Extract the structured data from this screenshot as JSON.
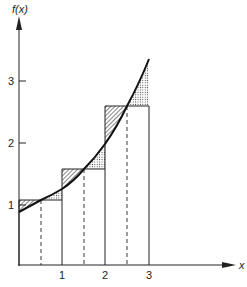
{
  "diagram": {
    "type": "midpoint-riemann-sum",
    "y_axis_label": "f(x)",
    "x_axis_label": "x",
    "x_ticks": [
      "1",
      "2",
      "3"
    ],
    "y_ticks": [
      "1",
      "2",
      "3"
    ],
    "function_samples": [
      {
        "x": 0.0,
        "y": 0.88
      },
      {
        "x": 0.5,
        "y": 1.07
      },
      {
        "x": 1.0,
        "y": 1.25
      },
      {
        "x": 1.5,
        "y": 1.57
      },
      {
        "x": 2.0,
        "y": 1.98
      },
      {
        "x": 2.5,
        "y": 2.6
      },
      {
        "x": 3.0,
        "y": 3.35
      }
    ],
    "rectangles": [
      {
        "x0": 0,
        "x1": 1,
        "midpoint": 0.5,
        "height": 1.07
      },
      {
        "x0": 1,
        "x1": 2,
        "midpoint": 1.5,
        "height": 1.57
      },
      {
        "x0": 2,
        "x1": 3,
        "midpoint": 2.5,
        "height": 2.6
      }
    ],
    "shading": {
      "hatched": "rectangle above curve (left half of each interval)",
      "dotted": "curve above rectangle (right half of each interval)"
    },
    "colors": {
      "ink": "#222222",
      "background": "#ffffff"
    }
  }
}
